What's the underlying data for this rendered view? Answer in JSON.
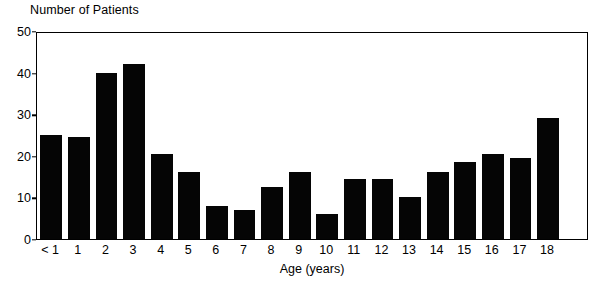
{
  "chart_data": {
    "type": "bar",
    "title": "Number of Patients",
    "xlabel": "Age (years)",
    "ylabel": "Number of Patients",
    "categories": [
      "< 1",
      "1",
      "2",
      "3",
      "4",
      "5",
      "6",
      "7",
      "8",
      "9",
      "10",
      "11",
      "12",
      "13",
      "14",
      "15",
      "16",
      "17",
      "18"
    ],
    "values": [
      25,
      24.5,
      40,
      42,
      20.5,
      16,
      8,
      7,
      12.5,
      16,
      6,
      14.5,
      14.5,
      10,
      16,
      18.5,
      20.5,
      19.5,
      29
    ],
    "ylim": [
      0,
      50
    ],
    "yticks": [
      0,
      10,
      20,
      30,
      40,
      50
    ],
    "ytick_labels": [
      "0",
      "10",
      "20",
      "30",
      "40",
      "50"
    ],
    "grid": false,
    "legend": null,
    "bar_color": "#050505",
    "background_color": "#ffffff",
    "axis_color": "#000000"
  }
}
